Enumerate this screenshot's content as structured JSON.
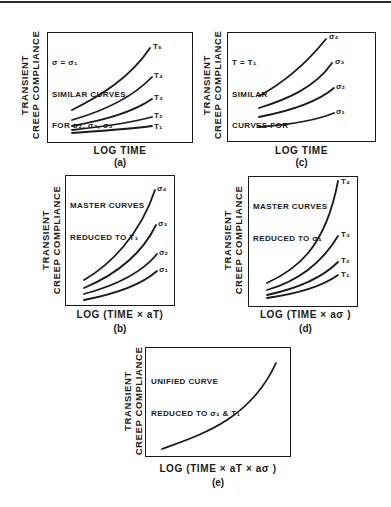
{
  "figure": {
    "panels": [
      {
        "id": "a",
        "caption": "(a)",
        "ylabel_line1": "TRANSIENT",
        "ylabel_line2": "CREEP COMPLIANCE",
        "xlabel": "LOG TIME",
        "note_line1": "σ = σ₁",
        "note_line2": "SIMILAR CURVES",
        "note_line3": "FOR σ₂, σ₃, σ₄",
        "curve_labels": [
          "T₅",
          "T₄",
          "T₃",
          "T₂",
          "T₁"
        ]
      },
      {
        "id": "c",
        "caption": "(c)",
        "ylabel_line1": "TRANSIENT",
        "ylabel_line2": "CREEP COMPLIANCE",
        "xlabel": "LOG TIME",
        "note_line1": "T = T₁",
        "note_line2": "SIMILAR",
        "note_line3": "CURVES FOR",
        "curve_labels": [
          "σ₄",
          "σ₃",
          "σ₂",
          "σ₁"
        ]
      },
      {
        "id": "b",
        "caption": "(b)",
        "ylabel_line1": "TRANSIENT",
        "ylabel_line2": "CREEP COMPLIANCE",
        "xlabel": "LOG (TIME × aT)",
        "note_line1": "MASTER CURVES",
        "note_line2": "REDUCED TO T₁",
        "curve_labels": [
          "σ₄",
          "σ₃",
          "σ₂",
          "σ₁"
        ]
      },
      {
        "id": "d",
        "caption": "(d)",
        "ylabel_line1": "TRANSIENT",
        "ylabel_line2": "CREEP COMPLIANCE",
        "xlabel": "LOG (TIME × aσ )",
        "note_line1": "MASTER CURVES",
        "note_line2": "REDUCED TO σ₁",
        "curve_labels": [
          "T₄",
          "T₃",
          "T₂",
          "T₁"
        ]
      },
      {
        "id": "e",
        "caption": "(e)",
        "ylabel_line1": "TRANSIENT",
        "ylabel_line2": "CREEP COMPLIANCE",
        "xlabel": "LOG (TIME × aT × aσ )",
        "note_line1": "UNIFIED CURVE",
        "note_line2": "REDUCED TO σ₁ & T₁",
        "curve_labels": []
      }
    ]
  }
}
